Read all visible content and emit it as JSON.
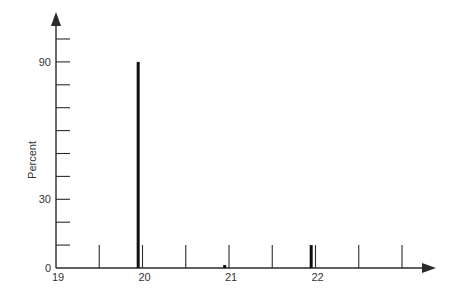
{
  "chart_data": {
    "type": "bar",
    "title": "",
    "xlabel": "",
    "ylabel": "Percent",
    "xlim": [
      19,
      23
    ],
    "ylim": [
      0,
      100
    ],
    "grid": false,
    "legend": null,
    "x_tick_labels": [
      "19",
      "20",
      "21",
      "22"
    ],
    "x_minor_ticks": [
      19.5,
      20,
      20.5,
      21,
      21.5,
      22,
      22.5,
      23
    ],
    "y_tick_labels": [
      "0",
      "30",
      "90"
    ],
    "y_ticks": [
      0,
      10,
      20,
      30,
      40,
      50,
      60,
      70,
      80,
      90,
      100
    ],
    "series": [
      {
        "name": "Percent",
        "x": [
          19.95,
          20.95,
          21.95
        ],
        "values": [
          90,
          1,
          10
        ]
      }
    ]
  },
  "axes": {
    "y_label": "Percent",
    "y_labels": [
      {
        "v": 0,
        "t": "0"
      },
      {
        "v": 30,
        "t": "30"
      },
      {
        "v": 90,
        "t": "90"
      }
    ],
    "x_labels": [
      {
        "v": 19,
        "t": "19"
      },
      {
        "v": 20,
        "t": "20"
      },
      {
        "v": 21,
        "t": "21"
      },
      {
        "v": 22,
        "t": "22"
      }
    ]
  },
  "colors": {
    "axis": "#2a2a2a",
    "bar": "#111111",
    "text": "#333333"
  }
}
